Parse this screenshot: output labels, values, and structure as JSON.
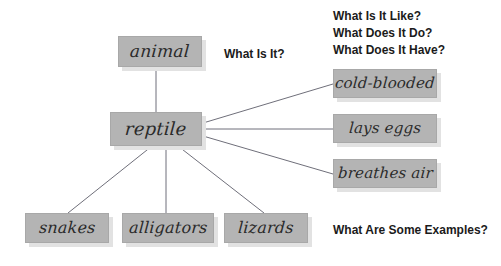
{
  "diagram": {
    "type": "concept-map",
    "title_subject": "reptile",
    "colors": {
      "box_fill": "#b4b4b4",
      "box_border": "#a8a8a8",
      "box_shadow": "#e2e2e2",
      "line": "#6f6f7a",
      "text": "#2a2a2a",
      "label_text": "#1b1b1b",
      "background": "#ffffff"
    },
    "nodes": [
      {
        "id": "animal",
        "label": "animal",
        "x": 118,
        "y": 36,
        "w": 84,
        "h": 31,
        "font_size": 17
      },
      {
        "id": "reptile",
        "label": "reptile",
        "x": 110,
        "y": 112,
        "w": 92,
        "h": 34,
        "font_size": 18
      },
      {
        "id": "cold-blooded",
        "label": "cold-blooded",
        "x": 333,
        "y": 69,
        "w": 104,
        "h": 29,
        "font_size": 15
      },
      {
        "id": "lays-eggs",
        "label": "lays eggs",
        "x": 333,
        "y": 114,
        "w": 104,
        "h": 29,
        "font_size": 15
      },
      {
        "id": "breathes-air",
        "label": "breathes air",
        "x": 333,
        "y": 159,
        "w": 104,
        "h": 29,
        "font_size": 15
      },
      {
        "id": "snakes",
        "label": "snakes",
        "x": 25,
        "y": 213,
        "w": 84,
        "h": 30,
        "font_size": 16
      },
      {
        "id": "alligators",
        "label": "alligators",
        "x": 122,
        "y": 213,
        "w": 92,
        "h": 30,
        "font_size": 16
      },
      {
        "id": "lizards",
        "label": "lizards",
        "x": 224,
        "y": 213,
        "w": 84,
        "h": 30,
        "font_size": 16
      }
    ],
    "edges": [
      {
        "from": "reptile",
        "to": "animal",
        "x1": 156,
        "y1": 112,
        "x2": 156,
        "y2": 67
      },
      {
        "from": "reptile",
        "to": "cold-blooded",
        "x1": 203,
        "y1": 123,
        "x2": 333,
        "y2": 84
      },
      {
        "from": "reptile",
        "to": "lays-eggs",
        "x1": 203,
        "y1": 129,
        "x2": 333,
        "y2": 129
      },
      {
        "from": "reptile",
        "to": "breathes-air",
        "x1": 203,
        "y1": 136,
        "x2": 333,
        "y2": 174
      },
      {
        "from": "reptile",
        "to": "snakes",
        "x1": 152,
        "y1": 146,
        "x2": 68,
        "y2": 213
      },
      {
        "from": "reptile",
        "to": "alligators",
        "x1": 166,
        "y1": 146,
        "x2": 166,
        "y2": 213
      },
      {
        "from": "reptile",
        "to": "lizards",
        "x1": 178,
        "y1": 146,
        "x2": 264,
        "y2": 213
      }
    ],
    "labels": [
      {
        "id": "what-is-it",
        "lines": [
          "What Is It?"
        ],
        "x": 224,
        "y": 46,
        "font_size": 12
      },
      {
        "id": "attributes-questions",
        "lines": [
          "What Is It Like?",
          "What Does It Do?",
          "What Does It Have?"
        ],
        "x": 333,
        "y": 8,
        "font_size": 12
      },
      {
        "id": "examples-question",
        "lines": [
          "What Are Some Examples?"
        ],
        "x": 333,
        "y": 222,
        "font_size": 12
      }
    ]
  }
}
